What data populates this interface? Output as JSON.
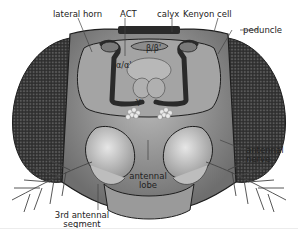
{
  "figure": {
    "labels": {
      "lateral_horn": "lateral horn",
      "act": "ACT",
      "calyx": "calyx",
      "kenyon_cell": "Kenyon cell",
      "peduncle": "peduncle",
      "alpha_alpha": "α/α'",
      "beta_beta": "β/β'",
      "gamma": "γ",
      "antennal_nerve_1": "antennal",
      "antennal_nerve_2": "nerve",
      "antennal_lobe_1": "antennal",
      "antennal_lobe_2": "lobe",
      "third_segment_1": "3rd antennal",
      "third_segment_2": "segment"
    },
    "colors": {
      "eye": "#3a3a3a",
      "head": "#8a8a8a",
      "brain": "#a8a8a8",
      "lobe": "#c8c8c8",
      "outline": "#1e1e1e"
    }
  }
}
